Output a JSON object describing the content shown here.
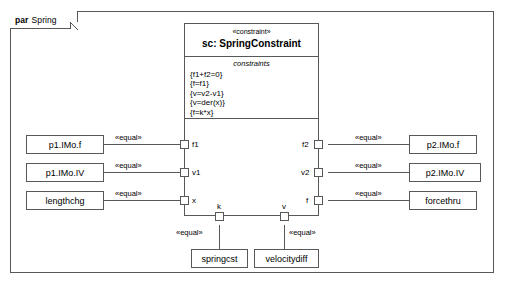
{
  "frame": {
    "keyword": "par",
    "name": "Spring"
  },
  "constraint_block": {
    "stereotype": "«constraint»",
    "name": "sc: SpringConstraint",
    "compartment_title": "constraints",
    "constraints": [
      "{f1+f2=0}",
      "{f=f1}",
      "{v=v2-v1}",
      "{v=der(x)}",
      "{f=k*x}"
    ],
    "ports": {
      "left": [
        "f1",
        "v1",
        "x"
      ],
      "right": [
        "f2",
        "v2",
        "f"
      ],
      "bottom": [
        "k",
        "v"
      ]
    }
  },
  "left_boxes": [
    {
      "label": "p1.IMo.f"
    },
    {
      "label": "p1.IMo.IV"
    },
    {
      "label": "lengthchg"
    }
  ],
  "right_boxes": [
    {
      "label": "p2.IMo.f"
    },
    {
      "label": "p2.IMo.IV"
    },
    {
      "label": "forcethru"
    }
  ],
  "bottom_boxes": [
    {
      "label": "springcst"
    },
    {
      "label": "velocitydiff"
    }
  ],
  "connector_label": "«equal»",
  "connectors": {
    "left": [
      "«equal»",
      "«equal»",
      "«equal»"
    ],
    "right": [
      "«equal»",
      "«equal»",
      "«equal»"
    ],
    "bottom": [
      "«equal»",
      "«equal»"
    ]
  },
  "colors": {
    "stroke": "#58585a",
    "background": "#ffffff",
    "text": "#000000"
  }
}
